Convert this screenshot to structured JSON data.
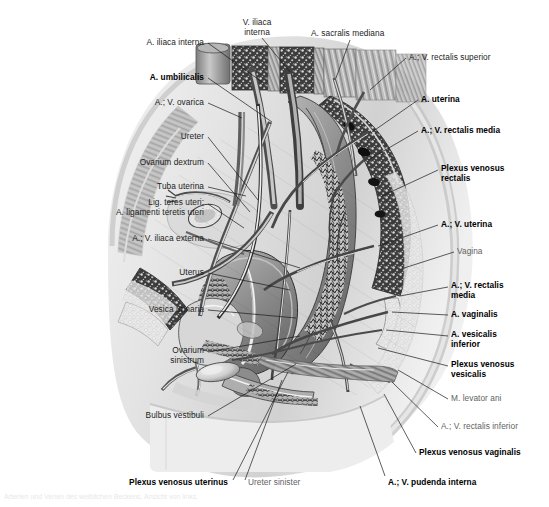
{
  "plate": {
    "title": "Weibliches Becken – Arterien und Venen (Medianschnitt)",
    "caption": "Arterien und Venen des weiblichen Beckens, Ansicht von links.",
    "background": "#ffffff",
    "text_color": "#1c1c1c",
    "muted_text_color": "#636363",
    "leader_color": "#1a1a1a",
    "width": 549,
    "height": 507
  },
  "labels": [
    {
      "id": "v-iliaca-interna",
      "text": "V. iliaca\ninterna",
      "bold": false,
      "muted": false,
      "align": "center",
      "x": 229,
      "y": 18,
      "w": 56,
      "lx": 262,
      "ly": 38,
      "tx": 290,
      "ty": 72
    },
    {
      "id": "a-sacralis-mediana",
      "text": "A. sacralis mediana",
      "bold": false,
      "muted": false,
      "align": "left",
      "x": 311,
      "y": 29,
      "w": 110,
      "lx": 350,
      "ly": 40,
      "tx": 336,
      "ty": 78
    },
    {
      "id": "a-iliaca-interna",
      "text": "A. iliaca interna",
      "bold": false,
      "muted": false,
      "align": "right",
      "x": 60,
      "y": 38,
      "w": 144,
      "lx": 208,
      "ly": 43,
      "tx": 262,
      "ty": 82
    },
    {
      "id": "av-rectalis-superior",
      "text": "A.; V. rectalis superior",
      "bold": false,
      "muted": false,
      "align": "left",
      "x": 409,
      "y": 53,
      "w": 132,
      "lx": 406,
      "ly": 58,
      "tx": 370,
      "ty": 90
    },
    {
      "id": "a-umbilicalis",
      "text": "A. umbilicalis",
      "bold": true,
      "muted": false,
      "align": "right",
      "x": 60,
      "y": 73,
      "w": 144,
      "lx": 208,
      "ly": 78,
      "tx": 272,
      "ty": 122
    },
    {
      "id": "av-ovarica",
      "text": "A.; V. ovarica",
      "bold": false,
      "muted": false,
      "align": "right",
      "x": 60,
      "y": 98,
      "w": 144,
      "lx": 208,
      "ly": 103,
      "tx": 242,
      "ty": 118
    },
    {
      "id": "a-uterina",
      "text": "A. uterina",
      "bold": true,
      "muted": false,
      "align": "left",
      "x": 421,
      "y": 95,
      "w": 120,
      "lx": 418,
      "ly": 100,
      "tx": 372,
      "ty": 132
    },
    {
      "id": "av-rectalis-media-top",
      "text": "A.; V. rectalis media",
      "bold": true,
      "muted": false,
      "align": "left",
      "x": 421,
      "y": 126,
      "w": 124,
      "lx": 418,
      "ly": 131,
      "tx": 368,
      "ty": 160
    },
    {
      "id": "ureter",
      "text": "Ureter",
      "bold": false,
      "muted": false,
      "align": "right",
      "x": 80,
      "y": 132,
      "w": 124,
      "lx": 208,
      "ly": 137,
      "tx": 258,
      "ty": 200
    },
    {
      "id": "plexus-venosus-rectalis",
      "text": "Plexus venosus\nrectalis",
      "bold": true,
      "muted": false,
      "align": "left",
      "x": 441,
      "y": 164,
      "w": 106,
      "lx": 438,
      "ly": 170,
      "tx": 382,
      "ty": 196
    },
    {
      "id": "ovarium-dextrum",
      "text": "Ovarium dextrum",
      "bold": false,
      "muted": false,
      "align": "right",
      "x": 60,
      "y": 158,
      "w": 144,
      "lx": 208,
      "ly": 163,
      "tx": 250,
      "ty": 212
    },
    {
      "id": "tuba-uterina",
      "text": "Tuba uterina",
      "bold": false,
      "muted": false,
      "align": "right",
      "x": 60,
      "y": 182,
      "w": 144,
      "lx": 208,
      "ly": 187,
      "tx": 246,
      "ty": 196
    },
    {
      "id": "lig-teres-uteri",
      "text": "Lig. teres uteri;\nA. ligamenti teretis uteri",
      "bold": false,
      "muted": false,
      "align": "right",
      "x": 24,
      "y": 198,
      "w": 180,
      "lx": 208,
      "ly": 204,
      "tx": 244,
      "ty": 228
    },
    {
      "id": "av-uterina",
      "text": "A.; V. uterina",
      "bold": true,
      "muted": false,
      "align": "left",
      "x": 441,
      "y": 220,
      "w": 106,
      "lx": 438,
      "ly": 225,
      "tx": 378,
      "ty": 246
    },
    {
      "id": "av-iliaca-externa",
      "text": "A.; V. iliaca externa",
      "bold": false,
      "muted": false,
      "align": "right",
      "x": 24,
      "y": 234,
      "w": 180,
      "lx": 208,
      "ly": 239,
      "tx": 300,
      "ty": 268
    },
    {
      "id": "vagina",
      "text": "Vagina",
      "bold": false,
      "muted": true,
      "align": "left",
      "x": 457,
      "y": 247,
      "w": 90,
      "lx": 454,
      "ly": 252,
      "tx": 404,
      "ty": 268
    },
    {
      "id": "uterus",
      "text": "Uterus",
      "bold": false,
      "muted": false,
      "align": "right",
      "x": 40,
      "y": 268,
      "w": 164,
      "lx": 208,
      "ly": 273,
      "tx": 290,
      "ty": 290
    },
    {
      "id": "av-rectalis-media-low",
      "text": "A.; V. rectalis\nmedia",
      "bold": true,
      "muted": false,
      "align": "left",
      "x": 451,
      "y": 281,
      "w": 96,
      "lx": 448,
      "ly": 287,
      "tx": 400,
      "ty": 296
    },
    {
      "id": "a-vaginalis",
      "text": "A. vaginalis",
      "bold": true,
      "muted": false,
      "align": "left",
      "x": 451,
      "y": 310,
      "w": 96,
      "lx": 448,
      "ly": 315,
      "tx": 392,
      "ty": 312
    },
    {
      "id": "vesica-urinaria",
      "text": "Vesica urinaria",
      "bold": false,
      "muted": false,
      "align": "right",
      "x": 40,
      "y": 305,
      "w": 164,
      "lx": 208,
      "ly": 310,
      "tx": 296,
      "ty": 318
    },
    {
      "id": "a-vesicalis-inferior",
      "text": "A. vesicalis\ninferior",
      "bold": true,
      "muted": false,
      "align": "left",
      "x": 451,
      "y": 330,
      "w": 96,
      "lx": 448,
      "ly": 336,
      "tx": 386,
      "ty": 330
    },
    {
      "id": "ovarium-sinistrum",
      "text": "Ovarium\nsinistrum",
      "bold": false,
      "muted": false,
      "align": "right",
      "x": 40,
      "y": 346,
      "w": 164,
      "lx": 208,
      "ly": 352,
      "tx": 300,
      "ty": 336
    },
    {
      "id": "plexus-venosus-vesicalis",
      "text": "Plexus venosus\nvesicalis",
      "bold": true,
      "muted": false,
      "align": "left",
      "x": 451,
      "y": 360,
      "w": 96,
      "lx": 448,
      "ly": 366,
      "tx": 378,
      "ty": 348
    },
    {
      "id": "m-levator-ani",
      "text": "M. levator ani",
      "bold": false,
      "muted": true,
      "align": "left",
      "x": 451,
      "y": 394,
      "w": 96,
      "lx": 448,
      "ly": 399,
      "tx": 398,
      "ty": 370
    },
    {
      "id": "av-rectalis-inferior",
      "text": "A.; V. rectalis inferior",
      "bold": false,
      "muted": true,
      "align": "left",
      "x": 441,
      "y": 422,
      "w": 106,
      "lx": 438,
      "ly": 427,
      "tx": 392,
      "ty": 382
    },
    {
      "id": "bulbus-vestibuli",
      "text": "Bulbus vestibuli",
      "bold": false,
      "muted": false,
      "align": "right",
      "x": 40,
      "y": 411,
      "w": 164,
      "lx": 208,
      "ly": 416,
      "tx": 296,
      "ty": 364
    },
    {
      "id": "plexus-venosus-vaginalis",
      "text": "Plexus venosus vaginalis",
      "bold": true,
      "muted": false,
      "align": "left",
      "x": 419,
      "y": 448,
      "w": 128,
      "lx": 416,
      "ly": 453,
      "tx": 384,
      "ty": 394
    },
    {
      "id": "plexus-venosus-uterinus",
      "text": "Plexus venosus uterinus",
      "bold": true,
      "muted": false,
      "align": "right",
      "x": 48,
      "y": 478,
      "w": 180,
      "lx": 233,
      "ly": 480,
      "tx": 288,
      "ty": 372
    },
    {
      "id": "ureter-sinister",
      "text": "Ureter sinister",
      "bold": false,
      "muted": true,
      "align": "left",
      "x": 248,
      "y": 478,
      "w": 100,
      "lx": 245,
      "ly": 480,
      "tx": 282,
      "ty": 380
    },
    {
      "id": "av-pudenda-interna",
      "text": "A.; V. pudenda interna",
      "bold": true,
      "muted": false,
      "align": "left",
      "x": 388,
      "y": 478,
      "w": 140,
      "lx": 385,
      "ly": 476,
      "tx": 360,
      "ty": 406
    }
  ]
}
